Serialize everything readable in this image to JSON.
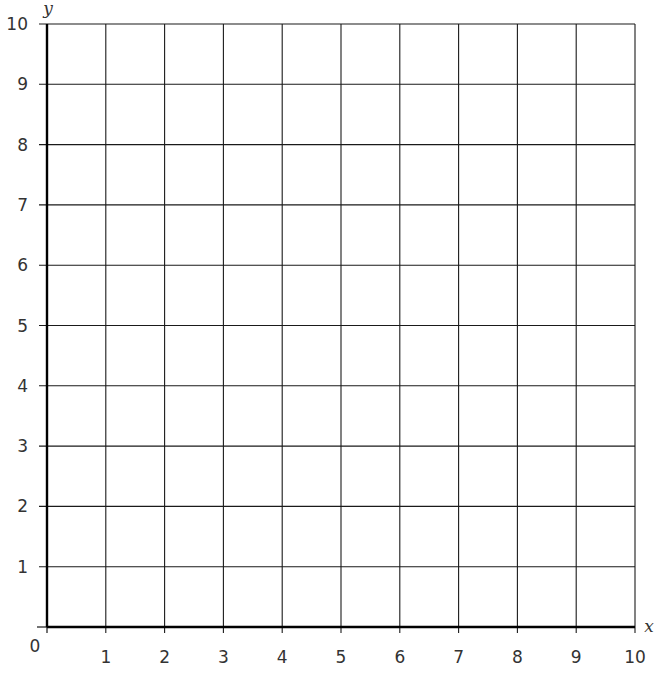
{
  "chart_data": {
    "type": "scatter",
    "title": "",
    "xlabel": "x",
    "ylabel": "y",
    "xlim": [
      0,
      10
    ],
    "ylim": [
      0,
      10
    ],
    "grid": true,
    "x_ticks": [
      "1",
      "2",
      "3",
      "4",
      "5",
      "6",
      "7",
      "8",
      "9",
      "10"
    ],
    "y_ticks": [
      "1",
      "2",
      "3",
      "4",
      "5",
      "6",
      "7",
      "8",
      "9",
      "10"
    ],
    "origin_label": "0",
    "series": [],
    "legend": null
  },
  "colors": {
    "grid": "#1a1a1a",
    "axis": "#000000",
    "text": "#333333"
  }
}
